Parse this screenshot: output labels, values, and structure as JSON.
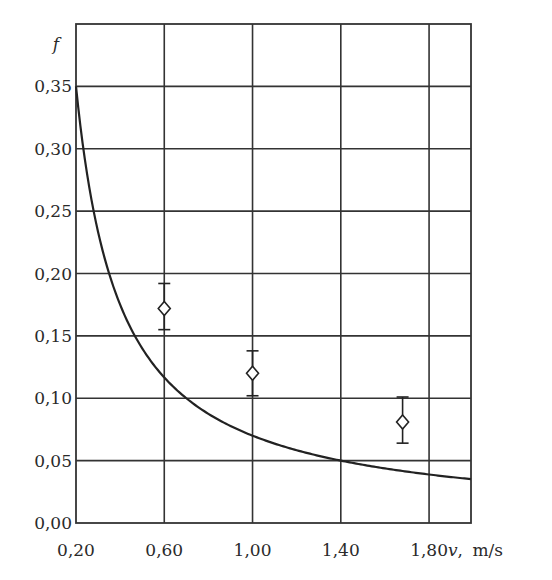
{
  "chart_data": {
    "type": "line",
    "title": "",
    "xlabel": "v, m/s",
    "xlabel_var": "v",
    "xlabel_unit": "m/s",
    "ylabel": "f",
    "xlim": [
      0.2,
      1.99
    ],
    "ylim": [
      0.0,
      0.4
    ],
    "grid": true,
    "legend": null,
    "x_ticks": [
      0.2,
      0.6,
      1.0,
      1.4,
      1.8
    ],
    "x_tick_labels": [
      "0,20",
      "0,60",
      "1,00",
      "1,40",
      "1,80"
    ],
    "y_ticks": [
      0.0,
      0.05,
      0.1,
      0.15,
      0.2,
      0.25,
      0.3,
      0.35
    ],
    "y_tick_labels": [
      "0,00",
      "0,05",
      "0,10",
      "0,15",
      "0,20",
      "0,25",
      "0,30",
      "0,35"
    ],
    "series": [
      {
        "name": "model curve",
        "kind": "line",
        "formula": "f = 0.07 / v",
        "x": [
          0.2,
          0.25,
          0.3,
          0.4,
          0.5,
          0.6,
          0.7,
          0.8,
          1.0,
          1.2,
          1.4,
          1.6,
          1.8,
          1.99
        ],
        "y": [
          0.35,
          0.28,
          0.233,
          0.175,
          0.14,
          0.117,
          0.1,
          0.088,
          0.07,
          0.058,
          0.05,
          0.044,
          0.039,
          0.035
        ]
      },
      {
        "name": "experimental data",
        "kind": "scatter",
        "marker": "diamond",
        "x": [
          0.6,
          1.0,
          1.68
        ],
        "y": [
          0.172,
          0.12,
          0.081
        ],
        "y_err_low": [
          0.155,
          0.102,
          0.064
        ],
        "y_err_high": [
          0.192,
          0.138,
          0.101
        ]
      }
    ]
  }
}
